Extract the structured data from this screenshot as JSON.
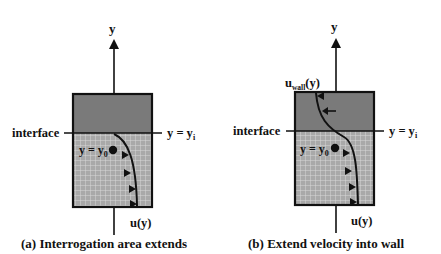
{
  "colors": {
    "wall": "#7a7a7a",
    "fluid": "#a9a9a9",
    "grid": "#d8d8d8",
    "line": "#111111",
    "background": "#ffffff"
  },
  "panels": [
    {
      "id": "a",
      "axis_label": "y",
      "interface_label": "interface",
      "interface_eq_label": "y = y",
      "interface_eq_sub": "i",
      "point_label": "y = y",
      "point_sub": "0",
      "velocity_label": "u(y)",
      "caption": "(a) Interrogation area extends"
    },
    {
      "id": "b",
      "axis_label": "y",
      "interface_label": "interface",
      "interface_eq_label": "y = y",
      "interface_eq_sub": "i",
      "point_label": "y = y",
      "point_sub": "0",
      "velocity_label": "u(y)",
      "wall_velocity_label": "u",
      "wall_velocity_sub": "wall",
      "wall_velocity_suffix": "(y)",
      "caption": "(b) Extend velocity into wall"
    }
  ]
}
